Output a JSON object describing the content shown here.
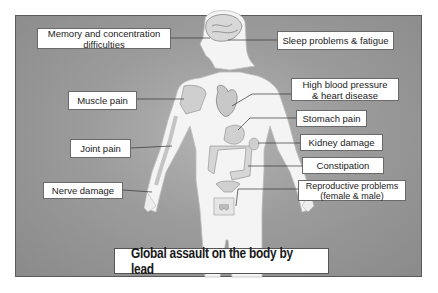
{
  "title": "Global assault on the body by lead",
  "colors": {
    "background": "#9c9c9c",
    "label_bg": "#ffffff",
    "body": "#f4f4f4",
    "leader_line": "#333333"
  },
  "labels_left": [
    {
      "id": "memory",
      "text": "Memory and concentration\ndifficulties",
      "target": "brain"
    },
    {
      "id": "muscle",
      "text": "Muscle pain",
      "target": "shoulder-muscle"
    },
    {
      "id": "joint",
      "text": "Joint pain",
      "target": "elbow"
    },
    {
      "id": "nerve",
      "text": "Nerve damage",
      "target": "hand"
    }
  ],
  "labels_right": [
    {
      "id": "sleep",
      "text": "Sleep problems & fatigue",
      "target": "brain"
    },
    {
      "id": "hbp",
      "text": "High blood pressure\n& heart disease",
      "target": "heart"
    },
    {
      "id": "stomach",
      "text": "Stomach pain",
      "target": "stomach"
    },
    {
      "id": "kidney",
      "text": "Kidney damage",
      "target": "kidney"
    },
    {
      "id": "constipation",
      "text": "Constipation",
      "target": "colon"
    },
    {
      "id": "reproductive",
      "text": "Reproductive problems\n(female & male)",
      "target": "reproductive-organs"
    }
  ]
}
